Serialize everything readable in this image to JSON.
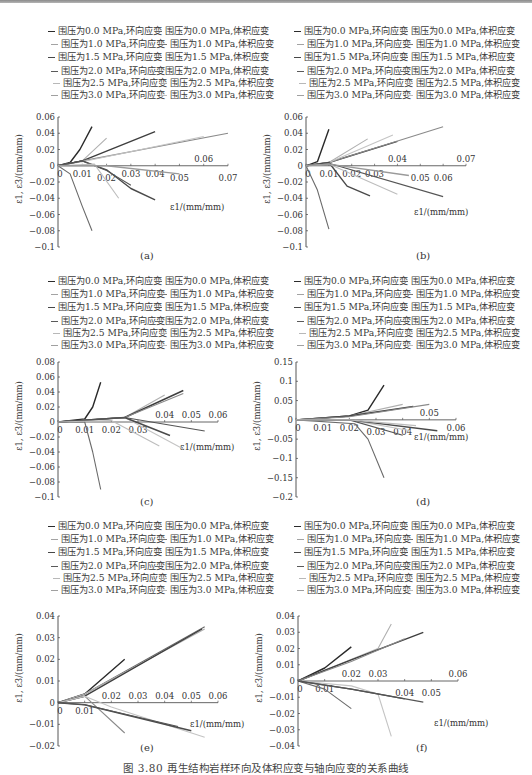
{
  "figure": {
    "caption": "图 3.80  再生结构岩样环向及体积应变与轴向应变的关系曲线",
    "colors": {
      "line_0_0_hoop": "#2b2b2b",
      "line_0_0_vol": "#555555",
      "line_1_0_hoop": "#9a9a9a",
      "line_1_0_vol": "#6e6e6e",
      "line_1_5_hoop": "#444444",
      "line_1_5_vol": "#7a7a7a",
      "line_2_0_hoop": "#3c3c3c",
      "line_2_0_vol": "#8c8c8c",
      "line_2_5_hoop": "#b0b0b0",
      "line_2_5_vol": "#c2c2c2",
      "line_3_0_hoop": "#a5a5a5",
      "line_3_0_vol": "#d0d0d0"
    }
  },
  "legend": {
    "rows": [
      {
        "left": "围压为0.0 MPa,环向应变",
        "right": "围压为0.0 MPa,体积应变"
      },
      {
        "left": "围压为1.0 MPa,环向应变",
        "right": "围压为1.0 MPa,体积应变"
      },
      {
        "left": "围压为1.5 MPa,环向应变",
        "right": "围压为1.5 MPa,体积应变"
      },
      {
        "left": "围压为2.0 MPa,环向应变",
        "right": "围压为2.0 MPa,体积应变"
      },
      {
        "left": "围压为2.5 MPa,环向应变",
        "right": "围压为2.5 MPa,体积应变"
      },
      {
        "left": "围压为3.0 MPa,环向应变",
        "right": "围压为3.0 MPa,体积应变"
      }
    ]
  },
  "axis_labels": {
    "ylabel": "ε1, ε3/(mm/mm)",
    "xlabel": "ε1/(mm/mm)"
  },
  "panels": [
    {
      "label": "(a)",
      "yticks": [
        "0.06",
        "0.04",
        "0.02",
        "0",
        "-0.02",
        "-0.04",
        "-0.06",
        "-0.08",
        "-0.1"
      ],
      "xticks": [
        "0",
        "0.01",
        "0.02",
        "0.03",
        "0.04",
        "0.05",
        "0.06",
        "0.07"
      ]
    },
    {
      "label": "(b)",
      "yticks": [
        "0.06",
        "0.04",
        "0.02",
        "0",
        "-0.02",
        "-0.04",
        "-0.06",
        "-0.08",
        "-0.1"
      ],
      "xticks": [
        "0",
        "0.01",
        "0.02",
        "0.03",
        "0.04",
        "0.05",
        "0.06",
        "0.07"
      ]
    },
    {
      "label": "(c)",
      "yticks": [
        "0.08",
        "0.06",
        "0.04",
        "0.02",
        "0",
        "-0.02",
        "-0.04",
        "-0.06",
        "-0.08",
        "-0.1"
      ],
      "xticks": [
        "0",
        "0.01",
        "0.02",
        "0.03",
        "0.04",
        "0.05",
        "0.06"
      ]
    },
    {
      "label": "(d)",
      "yticks": [
        "0.15",
        "0.1",
        "0.05",
        "0",
        "-0.05",
        "-0.1",
        "-0.15",
        "-0.2"
      ],
      "xticks": [
        "0",
        "0.01",
        "0.02",
        "0.03",
        "0.04",
        "0.05",
        "0.06"
      ]
    },
    {
      "label": "(e)",
      "yticks": [
        "0.04",
        "0.03",
        "0.02",
        "0.01",
        "0",
        "-0.01",
        "-0.02"
      ],
      "xticks": [
        "0",
        "0.01",
        "0.02",
        "0.03",
        "0.04",
        "0.05",
        "0.06"
      ]
    },
    {
      "label": "(f)",
      "yticks": [
        "0.04",
        "0.03",
        "0.02",
        "0.01",
        "0",
        "-0.01",
        "-0.02",
        "-0.03",
        "-0.04"
      ],
      "xticks": [
        "0",
        "0.01",
        "0.02",
        "0.03",
        "0.04",
        "0.05",
        "0.06"
      ]
    }
  ],
  "chart_data": [
    {
      "type": "line",
      "title": "(a)",
      "xlabel": "ε1/(mm/mm)",
      "ylabel": "ε1, ε3/(mm/mm)",
      "xlim": [
        0,
        0.07
      ],
      "ylim": [
        -0.1,
        0.06
      ],
      "grid": false,
      "legend_position": "top",
      "series": [
        {
          "name": "围压为0.0 MPa,体积应变",
          "x": [
            0,
            0.005,
            0.009,
            0.014
          ],
          "y": [
            0,
            0.004,
            0.02,
            0.048
          ]
        },
        {
          "name": "围压为0.0 MPa,环向应变",
          "x": [
            0,
            0.005,
            0.01,
            0.014
          ],
          "y": [
            0,
            -0.01,
            -0.05,
            -0.08
          ]
        },
        {
          "name": "围压为1.0 MPa,体积应变",
          "x": [
            0,
            0.01,
            0.02
          ],
          "y": [
            0,
            0.006,
            0.034
          ]
        },
        {
          "name": "围压为1.5 MPa,体积应变",
          "x": [
            0,
            0.01,
            0.04
          ],
          "y": [
            0,
            0.006,
            0.042
          ]
        },
        {
          "name": "围压为2.0 MPa,体积应变",
          "x": [
            0,
            0.01,
            0.07
          ],
          "y": [
            0,
            0.006,
            0.04
          ]
        },
        {
          "name": "围压为2.5 MPa,体积应变",
          "x": [
            0,
            0.01,
            0.06
          ],
          "y": [
            0,
            0.005,
            0.036
          ]
        },
        {
          "name": "围压为1.5 MPa,环向应变",
          "x": [
            0,
            0.01,
            0.02,
            0.03,
            0.04
          ],
          "y": [
            0,
            0.006,
            -0.005,
            -0.028,
            -0.042
          ]
        },
        {
          "name": "围压为2.0 MPa,环向应变",
          "x": [
            0,
            0.01,
            0.02,
            0.03
          ],
          "y": [
            0,
            0.006,
            -0.006,
            -0.024
          ]
        },
        {
          "name": "围压为2.5 MPa,环向应变",
          "x": [
            0,
            0.015,
            0.025
          ],
          "y": [
            0,
            0.002,
            -0.04
          ]
        },
        {
          "name": "围压为3.0 MPa,环向应变",
          "x": [
            0,
            0.02,
            0.05
          ],
          "y": [
            0,
            0.0,
            -0.01
          ]
        }
      ]
    },
    {
      "type": "line",
      "title": "(b)",
      "xlabel": "ε1/(mm/mm)",
      "ylabel": "ε1, ε3/(mm/mm)",
      "xlim": [
        0,
        0.07
      ],
      "ylim": [
        -0.1,
        0.06
      ],
      "grid": false,
      "legend_position": "top",
      "series": [
        {
          "name": "围压为0.0 MPa,体积应变",
          "x": [
            0,
            0.005,
            0.01
          ],
          "y": [
            0,
            0.005,
            0.045
          ]
        },
        {
          "name": "围压为0.0 MPa,环向应变",
          "x": [
            0,
            0.005,
            0.01
          ],
          "y": [
            0,
            -0.03,
            -0.078
          ]
        },
        {
          "name": "围压为1.0 MPa,体积应变",
          "x": [
            0,
            0.01,
            0.027
          ],
          "y": [
            0,
            0.004,
            0.033
          ]
        },
        {
          "name": "围压为1.5 MPa,体积应变",
          "x": [
            0,
            0.01,
            0.04
          ],
          "y": [
            0,
            0.004,
            0.03
          ]
        },
        {
          "name": "围压为2.0 MPa,体积应变",
          "x": [
            0,
            0.01,
            0.06
          ],
          "y": [
            0,
            0.004,
            0.048
          ]
        },
        {
          "name": "围压为2.5 MPa,体积应变",
          "x": [
            0,
            0.01,
            0.038
          ],
          "y": [
            0,
            0.004,
            0.038
          ]
        },
        {
          "name": "围压为1.5 MPa,环向应变",
          "x": [
            0,
            0.01,
            0.018,
            0.028
          ],
          "y": [
            0,
            0.004,
            -0.025,
            -0.037
          ]
        },
        {
          "name": "围压为2.0 MPa,环向应变",
          "x": [
            0,
            0.01,
            0.06
          ],
          "y": [
            0,
            0.003,
            -0.038
          ]
        },
        {
          "name": "围压为2.5 MPa,环向应变",
          "x": [
            0,
            0.01,
            0.04
          ],
          "y": [
            0,
            0.002,
            -0.035
          ]
        },
        {
          "name": "围压为3.0 MPa,环向应变",
          "x": [
            0,
            0.01,
            0.045
          ],
          "y": [
            0,
            0.002,
            -0.012
          ]
        }
      ]
    },
    {
      "type": "line",
      "title": "(c)",
      "xlabel": "ε1/(mm/mm)",
      "ylabel": "ε1, ε3/(mm/mm)",
      "xlim": [
        0,
        0.06
      ],
      "ylim": [
        -0.1,
        0.08
      ],
      "grid": false,
      "legend_position": "top",
      "series": [
        {
          "name": "围压为0.0 MPa,体积应变",
          "x": [
            0,
            0.01,
            0.013,
            0.016
          ],
          "y": [
            0,
            0.004,
            0.02,
            0.053
          ]
        },
        {
          "name": "围压为0.0 MPa,环向应变",
          "x": [
            0,
            0.01,
            0.013,
            0.016
          ],
          "y": [
            0,
            0.0,
            -0.04,
            -0.09
          ]
        },
        {
          "name": "围压为1.0 MPa,体积应变",
          "x": [
            0,
            0.025,
            0.04
          ],
          "y": [
            0,
            0.006,
            0.036
          ]
        },
        {
          "name": "围压为1.5 MPa,体积应变",
          "x": [
            0,
            0.025,
            0.047
          ],
          "y": [
            0,
            0.006,
            0.042
          ]
        },
        {
          "name": "围压为2.0 MPa,体积应变",
          "x": [
            0,
            0.025,
            0.047
          ],
          "y": [
            0,
            0.006,
            0.038
          ]
        },
        {
          "name": "围压为1.5 MPa,环向应变",
          "x": [
            0,
            0.025,
            0.047
          ],
          "y": [
            0,
            0.006,
            -0.036
          ]
        },
        {
          "name": "围压为2.0 MPa,环向应变",
          "x": [
            0,
            0.025,
            0.042
          ],
          "y": [
            0,
            0.006,
            -0.018
          ]
        },
        {
          "name": "围压为2.5 MPa,环向应变",
          "x": [
            0,
            0.025,
            0.055
          ],
          "y": [
            0,
            0.006,
            -0.012
          ]
        },
        {
          "name": "围压为3.0 MPa,环向应变",
          "x": [
            0,
            0.02,
            0.038
          ],
          "y": [
            0,
            0.002,
            -0.032
          ]
        }
      ]
    },
    {
      "type": "line",
      "title": "(d)",
      "xlabel": "ε1/(mm/mm)",
      "ylabel": "ε1, ε3/(mm/mm)",
      "xlim": [
        0,
        0.06
      ],
      "ylim": [
        -0.2,
        0.15
      ],
      "grid": false,
      "legend_position": "top",
      "series": [
        {
          "name": "围压为0.0 MPa,体积应变",
          "x": [
            0,
            0.02,
            0.027,
            0.033
          ],
          "y": [
            0,
            0.01,
            0.025,
            0.09
          ]
        },
        {
          "name": "围压为0.0 MPa,环向应变",
          "x": [
            0,
            0.022,
            0.027,
            0.033
          ],
          "y": [
            0,
            -0.01,
            -0.05,
            -0.15
          ]
        },
        {
          "name": "围压为1.0 MPa,体积应变",
          "x": [
            0,
            0.02,
            0.04
          ],
          "y": [
            0,
            0.01,
            0.04
          ]
        },
        {
          "name": "围压为1.5 MPa,体积应变",
          "x": [
            0,
            0.02,
            0.044
          ],
          "y": [
            0,
            0.01,
            0.035
          ]
        },
        {
          "name": "围压为2.0 MPa,体积应变",
          "x": [
            0,
            0.02,
            0.05
          ],
          "y": [
            0,
            0.008,
            0.04
          ]
        },
        {
          "name": "围压为1.5 MPa,环向应变",
          "x": [
            0,
            0.02,
            0.043
          ],
          "y": [
            0,
            0.0,
            -0.028
          ]
        },
        {
          "name": "围压为2.0 MPa,环向应变",
          "x": [
            0,
            0.02,
            0.053
          ],
          "y": [
            0,
            0.0,
            -0.028
          ]
        },
        {
          "name": "围压为2.5 MPa,环向应变",
          "x": [
            0,
            0.02,
            0.04
          ],
          "y": [
            0,
            0.0,
            -0.04
          ]
        },
        {
          "name": "围压为3.0 MPa,环向应变",
          "x": [
            0,
            0.02,
            0.045
          ],
          "y": [
            0,
            0.0,
            -0.015
          ]
        }
      ]
    },
    {
      "type": "line",
      "title": "(e)",
      "xlabel": "ε1/(mm/mm)",
      "ylabel": "ε1, ε3/(mm/mm)",
      "xlim": [
        0,
        0.06
      ],
      "ylim": [
        -0.02,
        0.04
      ],
      "grid": false,
      "legend_position": "top",
      "series": [
        {
          "name": "围压为1.0 MPa,体积应变",
          "x": [
            0,
            0.01,
            0.025
          ],
          "y": [
            0,
            0.004,
            0.02
          ]
        },
        {
          "name": "围压为1.5 MPa,体积应变",
          "x": [
            0,
            0.01,
            0.055
          ],
          "y": [
            0,
            0.004,
            0.035
          ]
        },
        {
          "name": "围压为2.0 MPa,体积应变",
          "x": [
            0,
            0.01,
            0.055
          ],
          "y": [
            0,
            0.004,
            0.034
          ]
        },
        {
          "name": "围压为2.5 MPa,体积应变",
          "x": [
            0,
            0.01,
            0.054
          ],
          "y": [
            0,
            0.003,
            0.034
          ]
        },
        {
          "name": "围压为1.5 MPa,环向应变",
          "x": [
            0,
            0.01,
            0.025
          ],
          "y": [
            0,
            0.003,
            -0.014
          ]
        },
        {
          "name": "围压为2.0 MPa,环向应变",
          "x": [
            0,
            0.01,
            0.02,
            0.055
          ],
          "y": [
            0,
            0.003,
            -0.002,
            -0.016
          ]
        },
        {
          "name": "围压为2.5 MPa,环向应变",
          "x": [
            0,
            0.01,
            0.05
          ],
          "y": [
            0,
            -0.001,
            -0.013
          ]
        },
        {
          "name": "围压为3.0 MPa,环向应变",
          "x": [
            0,
            0.01,
            0.045
          ],
          "y": [
            0,
            -0.001,
            -0.011
          ]
        }
      ]
    },
    {
      "type": "line",
      "title": "(f)",
      "xlabel": "ε1/(mm/mm)",
      "ylabel": "ε1, ε3/(mm/mm)",
      "xlim": [
        0,
        0.06
      ],
      "ylim": [
        -0.04,
        0.04
      ],
      "grid": false,
      "legend_position": "top",
      "series": [
        {
          "name": "围压为0.0 MPa,体积应变",
          "x": [
            0,
            0.01,
            0.02
          ],
          "y": [
            0,
            0.008,
            0.021
          ]
        },
        {
          "name": "围压为0.0 MPa,环向应变",
          "x": [
            0,
            0.01,
            0.02
          ],
          "y": [
            0,
            -0.005,
            -0.017
          ]
        },
        {
          "name": "围压为1.0 MPa,体积应变",
          "x": [
            0,
            0.03,
            0.035
          ],
          "y": [
            0,
            0.02,
            0.035
          ]
        },
        {
          "name": "围压为1.5 MPa,体积应变",
          "x": [
            0,
            0.02,
            0.047
          ],
          "y": [
            0,
            0.013,
            0.03
          ]
        },
        {
          "name": "围压为2.0 MPa,体积应变",
          "x": [
            0,
            0.02,
            0.04
          ],
          "y": [
            0,
            0.012,
            0.026
          ]
        },
        {
          "name": "围压为1.0 MPa,环向应变",
          "x": [
            0,
            0.02,
            0.03,
            0.035
          ],
          "y": [
            0,
            -0.003,
            -0.008,
            -0.034
          ]
        },
        {
          "name": "围压为1.5 MPa,环向应变",
          "x": [
            0,
            0.02,
            0.04
          ],
          "y": [
            0,
            -0.005,
            -0.011
          ]
        },
        {
          "name": "围压为2.5 MPa,环向应变",
          "x": [
            0,
            0.02,
            0.047
          ],
          "y": [
            0,
            -0.005,
            -0.013
          ]
        }
      ]
    }
  ]
}
